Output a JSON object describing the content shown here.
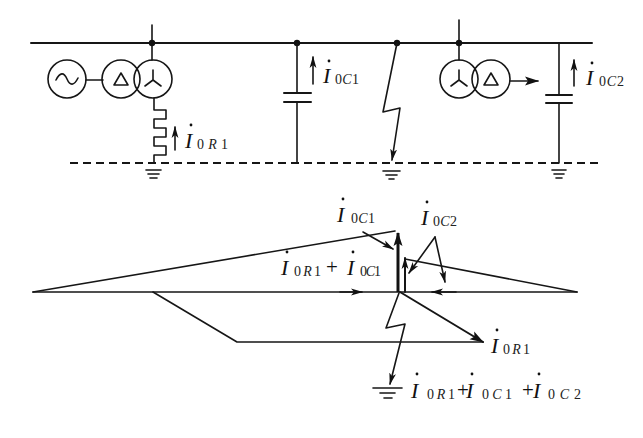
{
  "circuit": {
    "symbols": [
      "generator-icon",
      "delta-winding-icon",
      "wye-winding-icon",
      "grounding-resistor-icon",
      "capacitor-icon",
      "fault-lightning-icon",
      "ground-icon",
      "load-arrow-icon"
    ],
    "labels": {
      "i0r1": {
        "main": "I",
        "sub": [
          "0",
          "R",
          "1"
        ]
      },
      "i0c1": {
        "main": "I",
        "sub": [
          "0",
          "C",
          "1"
        ]
      },
      "i0c2": {
        "main": "I",
        "sub": [
          "0",
          "C",
          "2"
        ]
      }
    }
  },
  "phasor_diagram": {
    "label_i0c1": {
      "main": "I",
      "sub": [
        "0",
        "C",
        "1"
      ]
    },
    "label_i0c2": {
      "main": "I",
      "sub": [
        "0",
        "C",
        "2"
      ]
    },
    "label_sum_r1_c1": {
      "operator": "+",
      "terms": [
        {
          "main": "I",
          "sub": [
            "0",
            "R",
            "1"
          ]
        },
        {
          "main": "I",
          "sub": [
            "0",
            "C",
            "1"
          ]
        }
      ]
    },
    "label_i0r1": {
      "main": "I",
      "sub": [
        "0",
        "R",
        "1"
      ]
    },
    "label_total": {
      "operator": "+",
      "terms": [
        {
          "main": "I",
          "sub": [
            "0",
            "R",
            "1"
          ]
        },
        {
          "main": "I",
          "sub": [
            "0",
            "C",
            "1"
          ]
        },
        {
          "main": "I",
          "sub": [
            "0",
            "C",
            "2"
          ]
        }
      ]
    }
  },
  "colors": {
    "line": "#161616",
    "background": "#ffffff"
  }
}
